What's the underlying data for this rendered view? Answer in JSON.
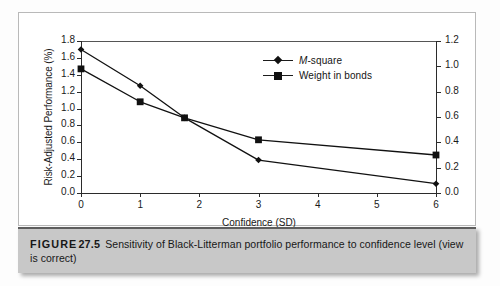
{
  "figure": {
    "caption_label": "FIGURE",
    "caption_number": "27.5",
    "caption_body": "Sensitivity of Black-Litterman portfolio performance to confidence level (view is correct)"
  },
  "chart_data": {
    "type": "line",
    "title": "",
    "xlabel": "Confidence (SD)",
    "ylabel": "Risk-Adjusted Performance (%)",
    "y2label": "",
    "x": [
      0,
      1,
      1.75,
      3,
      6
    ],
    "xlim": [
      0,
      6
    ],
    "xticks": [
      "0",
      "1",
      "2",
      "3",
      "4",
      "5",
      "6"
    ],
    "xtick_values": [
      0,
      1,
      2,
      3,
      4,
      5,
      6
    ],
    "ylim": [
      0,
      1.8
    ],
    "yticks": [
      "0.0",
      "0.2",
      "0.4",
      "0.6",
      "0.8",
      "1.0",
      "1.2",
      "1.4",
      "1.6",
      "1.8"
    ],
    "ytick_values": [
      0.0,
      0.2,
      0.4,
      0.6,
      0.8,
      1.0,
      1.2,
      1.4,
      1.6,
      1.8
    ],
    "y2lim": [
      0,
      1.2
    ],
    "y2ticks": [
      "0.0",
      "0.2",
      "0.4",
      "0.6",
      "0.8",
      "1.0",
      "1.2"
    ],
    "y2tick_values": [
      0.0,
      0.2,
      0.4,
      0.6,
      0.8,
      1.0,
      1.2
    ],
    "grid": false,
    "legend_position": "top-center",
    "series": [
      {
        "name": "M-square",
        "name_italic_prefix": "M",
        "name_rest": "-square",
        "axis": "left",
        "marker": "diamond",
        "color": "#111111",
        "values": [
          1.7,
          1.27,
          0.89,
          0.39,
          0.11
        ]
      },
      {
        "name": "Weight in bonds",
        "axis": "right",
        "marker": "square",
        "color": "#111111",
        "values": [
          0.98,
          0.72,
          0.595,
          0.42,
          0.3
        ],
        "values_on_left_scale": [
          1.47,
          1.08,
          0.89,
          0.63,
          0.45
        ]
      }
    ]
  }
}
